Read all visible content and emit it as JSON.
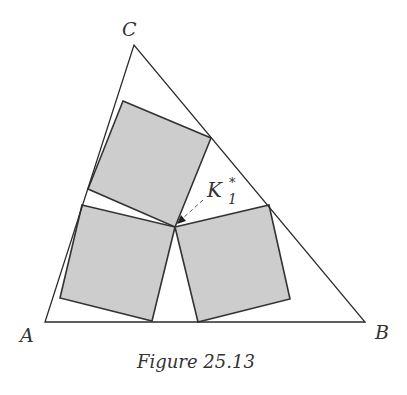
{
  "figure": {
    "caption": "Figure 25.13",
    "vertices": {
      "A": "A",
      "B": "B",
      "C": "C"
    },
    "point_label": {
      "main": "K",
      "subscript": "1",
      "superscript": "*"
    },
    "colors": {
      "square_fill": "#cdcdcd",
      "stroke": "#2b2b2b"
    },
    "shapes": {
      "triangle_count": 1,
      "square_count": 3,
      "description": "Three equal gray squares inscribed in triangle ABC, meeting at common point K1*"
    }
  }
}
